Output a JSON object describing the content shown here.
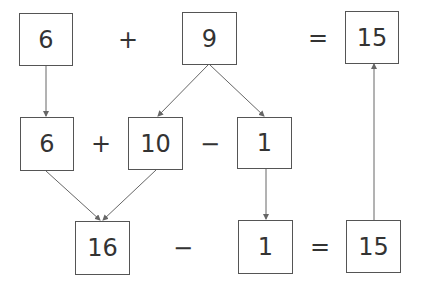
{
  "row1": {
    "a": "6",
    "op1": "+",
    "b": "9",
    "eq": "=",
    "result": "15"
  },
  "row2": {
    "a": "6",
    "op1": "+",
    "b": "10",
    "op2": "−",
    "c": "1"
  },
  "row3": {
    "a": "16",
    "op1": "−",
    "b": "1",
    "eq": "=",
    "result": "15"
  },
  "colors": {
    "line": "#666666",
    "text": "#333333"
  }
}
